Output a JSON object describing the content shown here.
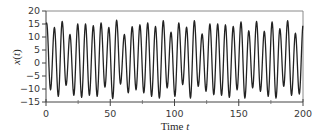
{
  "chart_data": {
    "type": "line",
    "title": "",
    "xlabel": "Time t",
    "xlabel_parts": {
      "text": "Time ",
      "var": "t"
    },
    "ylabel": "x(t)",
    "ylabel_parts": {
      "var": "x",
      "open": "(",
      "arg": "t",
      "close": ")"
    },
    "xlim": [
      0,
      200
    ],
    "ylim": [
      -15,
      20
    ],
    "xticks": [
      0,
      50,
      100,
      150,
      200
    ],
    "xtick_labels": [
      "0",
      "50",
      "100",
      "150",
      "200"
    ],
    "xminor_ticks": [
      25,
      75,
      125,
      175
    ],
    "yticks": [
      20,
      15,
      10,
      5,
      0,
      -5,
      -10,
      -15
    ],
    "ytick_labels": [
      "20",
      "15",
      "10",
      "5",
      "0",
      "−5",
      "−10",
      "−15"
    ],
    "grid": false,
    "legend": null,
    "line_color": "#222222",
    "series": [
      {
        "name": "x(t)",
        "description": "Quasi-periodic oscillation, period about 6 time units, sampled as alternating local maxima and minima",
        "first_peak_t": 0.5,
        "period": 6.05,
        "peaks": [
          15.4,
          13.7,
          16.0,
          11.0,
          15.0,
          15.0,
          14.4,
          15.4,
          13.7,
          16.5,
          11.0,
          14.0,
          14.7,
          15.4,
          14.1,
          16.3,
          11.9,
          15.4,
          13.8,
          16.3,
          11.2,
          15.0,
          15.0,
          14.7,
          14.1,
          15.8,
          12.4,
          16.0,
          12.2,
          15.8,
          13.2,
          16.3,
          11.5,
          15.0
        ],
        "troughs": [
          -10.3,
          -12.8,
          -8.6,
          -12.4,
          -13.2,
          -12.4,
          -12.8,
          -9.3,
          -13.7,
          -8.1,
          -11.5,
          -10.3,
          -11.5,
          -12.8,
          -13.5,
          -9.6,
          -12.8,
          -8.3,
          -13.5,
          -9.0,
          -10.9,
          -12.2,
          -12.4,
          -13.2,
          -10.3,
          -13.5,
          -9.6,
          -10.9,
          -12.8,
          -13.5,
          -9.0,
          -12.4,
          -12.0
        ]
      }
    ]
  }
}
